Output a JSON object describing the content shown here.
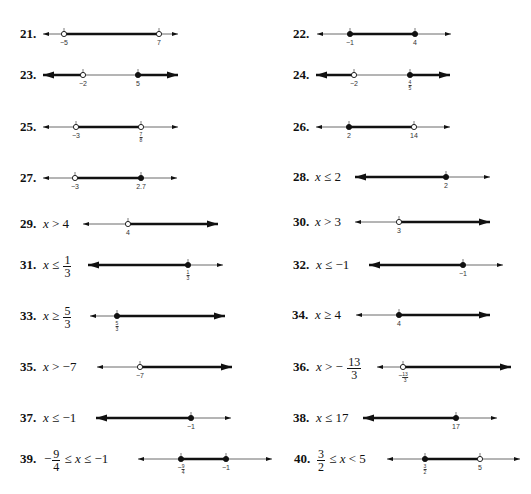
{
  "problems": [
    {
      "id": "21",
      "label": "21.",
      "expr": null,
      "y": 34,
      "label_x": 20,
      "line": [
        43,
        178
      ],
      "left_arrow": "thin",
      "right_arrow": "thin",
      "points": [
        {
          "value": "-5",
          "x": 64,
          "open": true
        },
        {
          "value": "7",
          "x": 159,
          "open": true
        }
      ],
      "shaded": [
        [
          64,
          159
        ]
      ]
    },
    {
      "id": "22",
      "label": "22.",
      "expr": null,
      "y": 34,
      "label_x": 293,
      "line": [
        317,
        451
      ],
      "left_arrow": "thin",
      "right_arrow": "thin",
      "points": [
        {
          "value": "-1",
          "x": 350,
          "open": false
        },
        {
          "value": "4",
          "x": 415,
          "open": false
        }
      ],
      "shaded": [
        [
          350,
          415
        ]
      ]
    },
    {
      "id": "23",
      "label": "23.",
      "expr": null,
      "y": 75,
      "label_x": 20,
      "line": [
        43,
        178
      ],
      "left_arrow": "thick",
      "right_arrow": "thick",
      "points": [
        {
          "value": "-2",
          "x": 83,
          "open": true
        },
        {
          "value": "5",
          "x": 138,
          "open": false
        }
      ],
      "shaded": [
        [
          43,
          83
        ],
        [
          138,
          178
        ]
      ]
    },
    {
      "id": "24",
      "label": "24.",
      "expr": null,
      "y": 75,
      "label_x": 293,
      "line": [
        316,
        450
      ],
      "left_arrow": "thick",
      "right_arrow": "thick",
      "points": [
        {
          "value": "-2",
          "x": 354,
          "open": true
        },
        {
          "value": "4/5",
          "x": 410,
          "open": false
        }
      ],
      "shaded": [
        [
          316,
          354
        ],
        [
          410,
          450
        ]
      ]
    },
    {
      "id": "25",
      "label": "25.",
      "expr": null,
      "y": 127,
      "label_x": 20,
      "line": [
        43,
        178
      ],
      "left_arrow": "thin",
      "right_arrow": "thin",
      "points": [
        {
          "value": "-3",
          "x": 76,
          "open": true
        },
        {
          "value": "7/8",
          "x": 141,
          "open": true
        }
      ],
      "shaded": [
        [
          76,
          141
        ]
      ]
    },
    {
      "id": "26",
      "label": "26.",
      "expr": null,
      "y": 127,
      "label_x": 293,
      "line": [
        316,
        450
      ],
      "left_arrow": "thin",
      "right_arrow": "thin",
      "points": [
        {
          "value": "2",
          "x": 349,
          "open": false
        },
        {
          "value": "14",
          "x": 414,
          "open": true
        }
      ],
      "shaded": [
        [
          349,
          414
        ]
      ]
    },
    {
      "id": "27",
      "label": "27.",
      "expr": null,
      "y": 178,
      "label_x": 20,
      "line": [
        43,
        177
      ],
      "left_arrow": "thin",
      "right_arrow": "thin",
      "points": [
        {
          "value": "-3",
          "x": 75,
          "open": true
        },
        {
          "value": "2.7",
          "x": 141,
          "open": false
        }
      ],
      "shaded": [
        [
          75,
          141
        ]
      ]
    },
    {
      "id": "28",
      "label": "28.",
      "expr": {
        "parts": [
          "x",
          "≤ 2"
        ]
      },
      "y": 177,
      "label_x": 293,
      "expr_x": 315,
      "line": [
        355,
        490
      ],
      "left_arrow": "thick",
      "right_arrow": "thin",
      "points": [
        {
          "value": "2",
          "x": 446,
          "open": false
        }
      ],
      "shaded": [
        [
          355,
          446
        ]
      ]
    },
    {
      "id": "29",
      "label": "29.",
      "expr": {
        "parts": [
          "x",
          "> 4"
        ]
      },
      "y": 224,
      "label_x": 20,
      "expr_x": 43,
      "line": [
        83,
        218
      ],
      "left_arrow": "thin",
      "right_arrow": "thick",
      "points": [
        {
          "value": "4",
          "x": 128,
          "open": true
        }
      ],
      "shaded": [
        [
          128,
          218
        ]
      ]
    },
    {
      "id": "30",
      "label": "30.",
      "expr": {
        "parts": [
          "x",
          "> 3"
        ]
      },
      "y": 222,
      "label_x": 293,
      "expr_x": 315,
      "line": [
        355,
        490
      ],
      "left_arrow": "thin",
      "right_arrow": "thick",
      "points": [
        {
          "value": "3",
          "x": 399,
          "open": true
        }
      ],
      "shaded": [
        [
          399,
          490
        ]
      ]
    },
    {
      "id": "31",
      "label": "31.",
      "expr": {
        "parts": [
          "x",
          "≤"
        ],
        "frac": {
          "num": "1",
          "den": "3"
        }
      },
      "y": 265,
      "label_x": 20,
      "expr_x": 43,
      "line": [
        88,
        223
      ],
      "left_arrow": "thick",
      "right_arrow": "thin",
      "points": [
        {
          "value": "1/3",
          "x": 188,
          "open": false
        }
      ],
      "shaded": [
        [
          88,
          188
        ]
      ]
    },
    {
      "id": "32",
      "label": "32.",
      "expr": {
        "parts": [
          "x",
          "≤ −1"
        ]
      },
      "y": 265,
      "label_x": 293,
      "expr_x": 316,
      "line": [
        369,
        503
      ],
      "left_arrow": "thick",
      "right_arrow": "thin",
      "points": [
        {
          "value": "-1",
          "x": 463,
          "open": false
        }
      ],
      "shaded": [
        [
          369,
          463
        ]
      ]
    },
    {
      "id": "33",
      "label": "33.",
      "expr": {
        "parts": [
          "x",
          "≥"
        ],
        "frac": {
          "num": "5",
          "den": "3"
        }
      },
      "y": 316,
      "label_x": 20,
      "expr_x": 43,
      "line": [
        90,
        225
      ],
      "left_arrow": "thin",
      "right_arrow": "thick",
      "points": [
        {
          "value": "5/3",
          "x": 117,
          "open": false
        }
      ],
      "shaded": [
        [
          117,
          225
        ]
      ]
    },
    {
      "id": "34",
      "label": "34.",
      "expr": {
        "parts": [
          "x",
          "≥ 4"
        ]
      },
      "y": 315,
      "label_x": 292,
      "expr_x": 315,
      "line": [
        356,
        490
      ],
      "left_arrow": "thin",
      "right_arrow": "thick",
      "points": [
        {
          "value": "4",
          "x": 399,
          "open": false
        }
      ],
      "shaded": [
        [
          399,
          490
        ]
      ]
    },
    {
      "id": "35",
      "label": "35.",
      "expr": {
        "parts": [
          "x",
          "> −7"
        ]
      },
      "y": 367,
      "label_x": 20,
      "expr_x": 43,
      "line": [
        97,
        232
      ],
      "left_arrow": "thin",
      "right_arrow": "thick",
      "points": [
        {
          "value": "-7",
          "x": 140,
          "open": true
        }
      ],
      "shaded": [
        [
          140,
          232
        ]
      ]
    },
    {
      "id": "36",
      "label": "36.",
      "expr": {
        "parts": [
          "x",
          "> −"
        ],
        "frac": {
          "num": "13",
          "den": "3"
        }
      },
      "y": 367,
      "label_x": 293,
      "expr_x": 316,
      "line": [
        377,
        511
      ],
      "left_arrow": "thin",
      "right_arrow": "thick",
      "points": [
        {
          "value": "-13/3",
          "x": 403,
          "open": true
        }
      ],
      "shaded": [
        [
          403,
          511
        ]
      ]
    },
    {
      "id": "37",
      "label": "37.",
      "expr": {
        "parts": [
          "x",
          "≤ −1"
        ]
      },
      "y": 418,
      "label_x": 20,
      "expr_x": 43,
      "line": [
        96,
        231
      ],
      "left_arrow": "thick",
      "right_arrow": "thin",
      "points": [
        {
          "value": "-1",
          "x": 191,
          "open": false
        }
      ],
      "shaded": [
        [
          96,
          191
        ]
      ]
    },
    {
      "id": "38",
      "label": "38.",
      "expr": {
        "parts": [
          "x",
          "≤ 17"
        ]
      },
      "y": 418,
      "label_x": 293,
      "expr_x": 316,
      "line": [
        363,
        497
      ],
      "left_arrow": "thick",
      "right_arrow": "thin",
      "points": [
        {
          "value": "17",
          "x": 456,
          "open": false
        }
      ],
      "shaded": [
        [
          363,
          456
        ]
      ]
    },
    {
      "id": "39",
      "label": "39.",
      "expr": {
        "prefix": "−",
        "frac": {
          "num": "9",
          "den": "4"
        },
        "parts": [
          "≤",
          "x",
          "≤ −1"
        ]
      },
      "y": 459,
      "label_x": 20,
      "expr_x": 44,
      "line": [
        138,
        272
      ],
      "left_arrow": "thin",
      "right_arrow": "thin",
      "points": [
        {
          "value": "-9/4",
          "x": 181,
          "open": false
        },
        {
          "value": "-1",
          "x": 226,
          "open": false
        }
      ],
      "shaded": [
        [
          181,
          226
        ]
      ]
    },
    {
      "id": "40",
      "label": "40.",
      "expr": {
        "prefix": "",
        "frac": {
          "num": "3",
          "den": "2"
        },
        "parts": [
          "≤",
          "x",
          "< 5"
        ]
      },
      "y": 459,
      "label_x": 294,
      "expr_x": 316,
      "line": [
        387,
        520
      ],
      "left_arrow": "thin",
      "right_arrow": "thin",
      "points": [
        {
          "value": "3/2",
          "x": 425,
          "open": false
        },
        {
          "value": "5",
          "x": 480,
          "open": true
        }
      ],
      "shaded": [
        [
          425,
          480
        ]
      ]
    }
  ]
}
